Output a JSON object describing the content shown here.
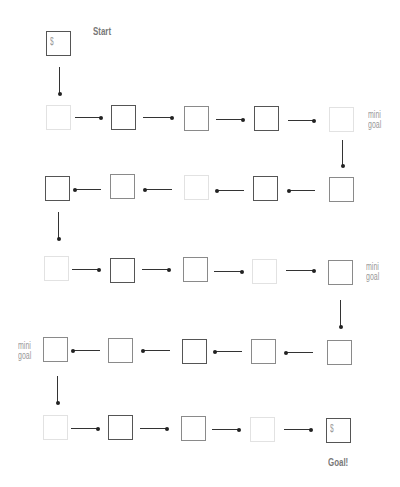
{
  "labels": {
    "start": "Start",
    "goal": "Goal!",
    "mini_goal_line1": "mini",
    "mini_goal_line2": "goal",
    "dollar": "$"
  },
  "board": {
    "start_box": {
      "symbol": "$"
    },
    "goal_box": {
      "symbol": "$"
    },
    "rows": [
      {
        "direction": "right",
        "shades": [
          "light",
          "dark",
          "mid",
          "dark",
          "light"
        ],
        "end_label": "mini goal"
      },
      {
        "direction": "left",
        "shades": [
          "dark",
          "mid",
          "light",
          "dark",
          "mid"
        ]
      },
      {
        "direction": "right",
        "shades": [
          "light",
          "dark",
          "mid",
          "light",
          "mid"
        ],
        "end_label": "mini goal"
      },
      {
        "direction": "left",
        "shades": [
          "mid",
          "mid",
          "dark",
          "mid",
          "mid"
        ],
        "end_label": "mini goal"
      },
      {
        "direction": "right",
        "shades": [
          "light",
          "dark",
          "mid",
          "light",
          "dark"
        ],
        "end_label": "Goal!"
      }
    ]
  }
}
